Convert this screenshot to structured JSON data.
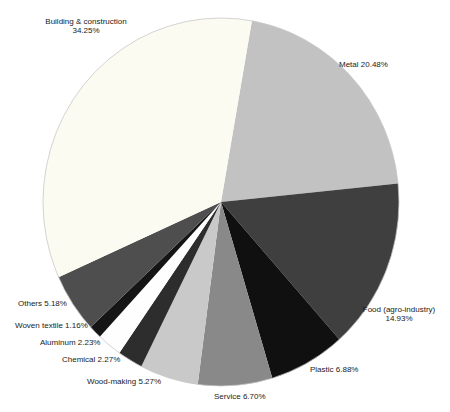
{
  "chart_data": {
    "type": "pie",
    "title": "",
    "legend": "none",
    "labels_position": "outside",
    "start_angle_deg": 10,
    "slices": [
      {
        "label": "Metal",
        "value": 20.48,
        "color": "#c2c2c2"
      },
      {
        "label": "Food (agro-industry)",
        "value": 14.93,
        "color": "#3f3f3f"
      },
      {
        "label": "Plastic",
        "value": 6.88,
        "color": "#101010"
      },
      {
        "label": "Service",
        "value": 6.7,
        "color": "#898989"
      },
      {
        "label": "Wood-making",
        "value": 5.27,
        "color": "#c9c9c9"
      },
      {
        "label": "Chemical",
        "value": 2.27,
        "color": "#2d2d2d"
      },
      {
        "label": "Aluminum",
        "value": 2.23,
        "color": "#fefefe"
      },
      {
        "label": "Woven textile",
        "value": 1.16,
        "color": "#151515"
      },
      {
        "label": "Others",
        "value": 5.18,
        "color": "#4e4e4e"
      },
      {
        "label": "Building & construction",
        "value": 34.25,
        "color": "#fbfbf2"
      }
    ],
    "labels": {
      "building": {
        "line1": "Building & construction",
        "line2": "34.25%"
      },
      "metal": {
        "text": "Metal 20.48%"
      },
      "food": {
        "line1": "Food (agro-industry)",
        "line2": "14.93%"
      },
      "plastic": {
        "text": "Plastic 6.88%"
      },
      "service": {
        "text": "Service 6.70%"
      },
      "wood": {
        "text": "Wood-making 5.27%"
      },
      "chemical": {
        "text": "Chemical 2.27%"
      },
      "aluminum": {
        "text": "Aluminum 2.23%"
      },
      "woven": {
        "text": "Woven textile 1.16%"
      },
      "others": {
        "text": "Others 5.18%"
      }
    },
    "outline_color": "#c6c6c6"
  }
}
